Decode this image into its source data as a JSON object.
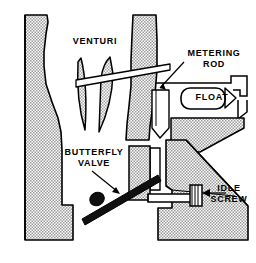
{
  "diagram": {
    "type": "technical-line-drawing",
    "background_color": "#ffffff",
    "line_color": "#000000",
    "hatch_fill_color": "#c9c9c9",
    "solid_part_color": "#111111"
  },
  "labels": {
    "venturi": "VENTURI",
    "metering_rod": "METERING\nROD",
    "float": "FLOAT",
    "butterfly_valve": "BUTTERFLY\nVALVE",
    "idle_screw": "IDLE\nSCREW"
  },
  "parts": [
    {
      "name": "venturi",
      "label": "VENTURI",
      "callout": false
    },
    {
      "name": "metering-rod",
      "label": "METERING ROD",
      "callout": true
    },
    {
      "name": "float",
      "label": "FLOAT",
      "callout": false
    },
    {
      "name": "butterfly-valve",
      "label": "BUTTERFLY VALVE",
      "callout": true
    },
    {
      "name": "idle-screw",
      "label": "IDLE SCREW",
      "callout": true
    }
  ]
}
